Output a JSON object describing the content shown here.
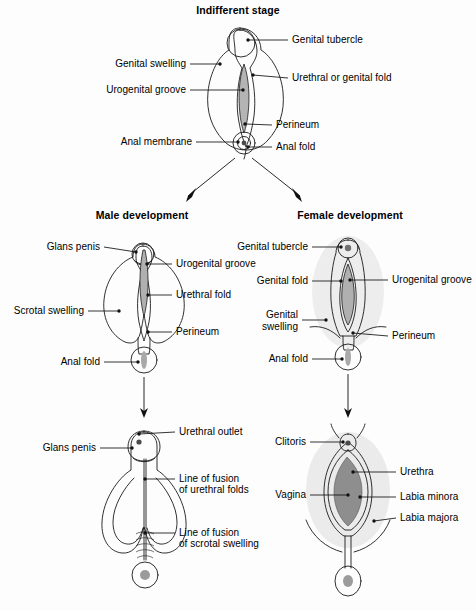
{
  "figure": {
    "title": "Indifferent stage",
    "palette": {
      "ink": "#1a1a1a",
      "swelling_fill": "#e8e8e8",
      "halo_fill": "#ededed",
      "fold_fill": "#f4f4f4",
      "groove_fill": "#b4b4b4",
      "anus_fill": "#c9c9c9",
      "anus_core": "#9a9a9a",
      "labia_minora_fill": "#b9b9b9",
      "vagina_fill": "#8e8e8e",
      "white": "#ffffff"
    }
  },
  "panels": {
    "indifferent": {
      "title": "Indifferent stage",
      "labels": {
        "genital_tubercle": "Genital tubercle",
        "genital_swelling": "Genital swelling",
        "urethral_or_genital_fold": "Urethral or genital fold",
        "urogenital_groove": "Urogenital groove",
        "perineum": "Perineum",
        "anal_membrane": "Anal membrane",
        "anal_fold": "Anal fold"
      }
    },
    "male_mid": {
      "title": "Male development",
      "labels": {
        "glans_penis": "Glans penis",
        "urogenital_groove": "Urogenital groove",
        "urethral_fold": "Urethral fold",
        "scrotal_swelling": "Scrotal swelling",
        "perineum": "Perineum",
        "anal_fold": "Anal fold"
      }
    },
    "female_mid": {
      "title": "Female development",
      "labels": {
        "genital_tubercle": "Genital tubercle",
        "genital_fold": "Genital fold",
        "urogenital_groove": "Urogenital groove",
        "genital_swelling_line1": "Genital",
        "genital_swelling_line2": "swelling",
        "perineum": "Perineum",
        "anal_fold": "Anal fold"
      }
    },
    "male_mature": {
      "labels": {
        "urethral_outlet": "Urethral outlet",
        "glans_penis": "Glans penis",
        "line_of_fusion_urethral_1": "Line of fusion",
        "line_of_fusion_urethral_2": "of urethral folds",
        "line_of_fusion_scrotal_1": "Line of fusion",
        "line_of_fusion_scrotal_2": "of scrotal swelling"
      }
    },
    "female_mature": {
      "labels": {
        "clitoris": "Clitoris",
        "urethra": "Urethra",
        "vagina": "Vagina",
        "labia_minora": "Labia minora",
        "labia_majora": "Labia majora"
      }
    }
  }
}
